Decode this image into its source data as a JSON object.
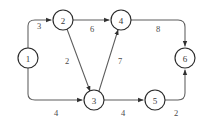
{
  "figure": {
    "kind": "directed-weighted-graph",
    "width": 209,
    "height": 121,
    "background_color": "#ffffff",
    "node_stroke_color": "#2b2b2b",
    "edge_stroke_color": "#5d5d5d",
    "label_color": "#4a4a4a"
  },
  "nodes": [
    {
      "id": "1",
      "label": "1",
      "cx": 28,
      "cy": 58,
      "r": 10
    },
    {
      "id": "2",
      "label": "2",
      "cx": 63,
      "cy": 20,
      "r": 10
    },
    {
      "id": "3",
      "label": "3",
      "cx": 94,
      "cy": 100,
      "r": 10
    },
    {
      "id": "4",
      "label": "4",
      "cx": 121,
      "cy": 20,
      "r": 10
    },
    {
      "id": "5",
      "label": "5",
      "cx": 155,
      "cy": 100,
      "r": 10
    },
    {
      "id": "6",
      "label": "6",
      "cx": 185,
      "cy": 58,
      "r": 10
    }
  ],
  "edges": [
    {
      "id": "e1-2",
      "from": "1",
      "to": "2",
      "weight": "3",
      "label_x": 39,
      "label_y": 26,
      "path": "M 28 48 L 28 26 Q 28 20 35 20 L 51 20"
    },
    {
      "id": "e2-4",
      "from": "2",
      "to": "4",
      "weight": "6",
      "label_x": 92,
      "label_y": 29,
      "path": "M 73 20 L 109 20"
    },
    {
      "id": "e4-6",
      "from": "4",
      "to": "6",
      "weight": "8",
      "label_x": 158,
      "label_y": 29,
      "path": "M 131 20 L 178 20 Q 185 20 185 27 L 185 46"
    },
    {
      "id": "e1-3",
      "from": "1",
      "to": "3",
      "weight": "4",
      "label_x": 56,
      "label_y": 113,
      "path": "M 28 68 L 28 94 Q 28 100 35 100 L 82 100"
    },
    {
      "id": "e2-3",
      "from": "2",
      "to": "3",
      "weight": "2",
      "label_x": 67,
      "label_y": 61,
      "path": "M 67 29 L 90 91"
    },
    {
      "id": "e3-4",
      "from": "3",
      "to": "4",
      "weight": "7",
      "label_x": 120,
      "label_y": 61,
      "path": "M 99 91 L 118 30"
    },
    {
      "id": "e3-5",
      "from": "3",
      "to": "5",
      "weight": "4",
      "label_x": 123,
      "label_y": 113,
      "path": "M 104 100 L 143 100"
    },
    {
      "id": "e5-6",
      "from": "5",
      "to": "6",
      "weight": "2",
      "label_x": 176,
      "label_y": 113,
      "path": "M 165 100 L 178 100 Q 185 100 185 93 L 185 70"
    }
  ]
}
